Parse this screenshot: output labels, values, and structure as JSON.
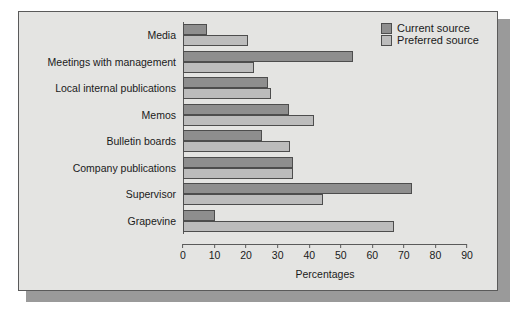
{
  "chart_data": {
    "type": "bar",
    "orientation": "horizontal",
    "title": "",
    "xlabel": "Percentages",
    "ylabel": "",
    "xlim": [
      0,
      90
    ],
    "xticks": [
      0,
      10,
      20,
      30,
      40,
      50,
      60,
      70,
      80,
      90
    ],
    "grid": false,
    "legend_position": "top-right",
    "categories": [
      "Media",
      "Meetings with management",
      "Local internal publications",
      "Memos",
      "Bulletin boards",
      "Company publications",
      "Supervisor",
      "Grapevine"
    ],
    "series": [
      {
        "name": "Current source",
        "color": "#8e8e8e",
        "values": [
          7.5,
          54,
          27,
          33.5,
          25,
          35,
          72.5,
          10
        ]
      },
      {
        "name": "Preferred source",
        "color": "#bcbcbc",
        "values": [
          20.5,
          22.5,
          28,
          41.5,
          34,
          35,
          44.5,
          67
        ]
      }
    ]
  },
  "legend": {
    "entries": [
      {
        "label": "Current source"
      },
      {
        "label": "Preferred source"
      }
    ]
  },
  "colors": {
    "current_source": "#8e8e8e",
    "preferred_source": "#bcbcbc",
    "plot_background": "#e4e4e2",
    "frame_border": "#5a5a5a",
    "shadow": "#9a9a9a"
  }
}
